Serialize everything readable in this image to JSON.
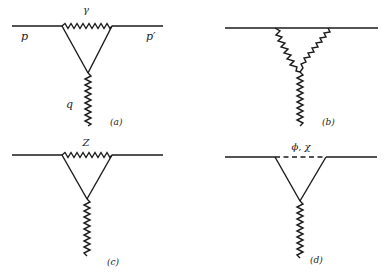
{
  "diagram": {
    "type": "feynman-diagrams",
    "panels": [
      {
        "id": "a",
        "caption": "(a)",
        "loop_boson_label": "γ",
        "incoming_label": "p",
        "outgoing_label": "p′",
        "external_boson_label": "q",
        "top_propagator": "wavy",
        "side_propagators": "straight",
        "external": "wavy"
      },
      {
        "id": "b",
        "caption": "(b)",
        "loop_boson_label": "",
        "top_propagator": "straight",
        "side_propagators": "wavy",
        "external": "wavy"
      },
      {
        "id": "c",
        "caption": "(c)",
        "loop_boson_label": "Z",
        "top_propagator": "wavy",
        "side_propagators": "straight",
        "external": "wavy"
      },
      {
        "id": "d",
        "caption": "(d)",
        "loop_boson_label": "ϕ, χ",
        "top_propagator": "dashed",
        "side_propagators": "straight",
        "external": "wavy"
      }
    ]
  }
}
